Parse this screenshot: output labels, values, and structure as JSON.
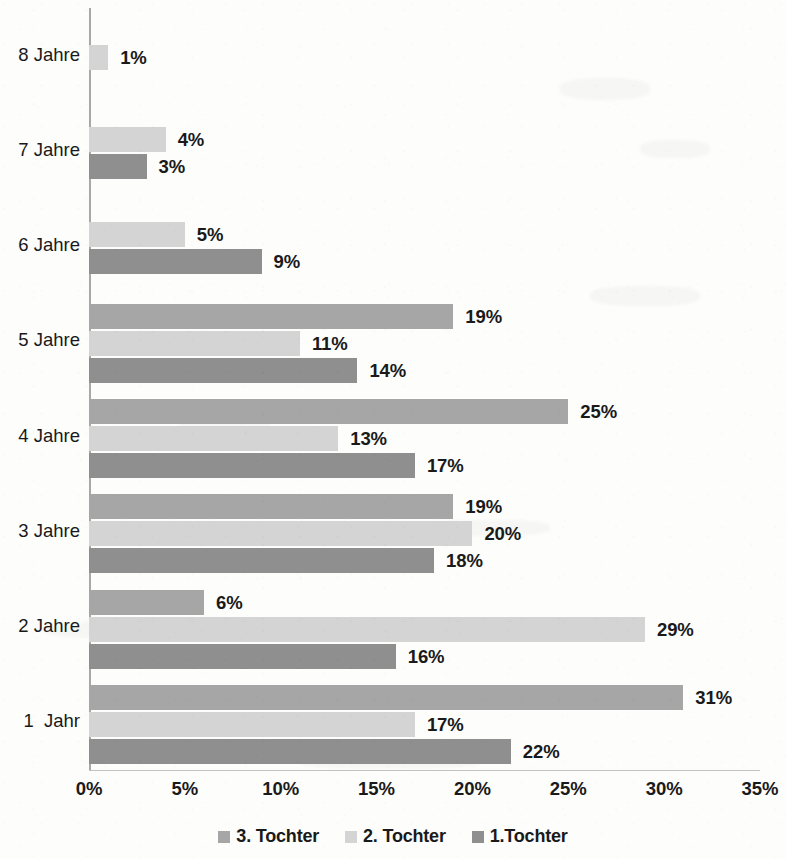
{
  "chart_data": {
    "type": "bar",
    "orientation": "horizontal",
    "title": "",
    "subtitle": "",
    "xlabel": "",
    "ylabel": "",
    "xlim": [
      0,
      35
    ],
    "xtick_labels": [
      "0%",
      "5%",
      "10%",
      "15%",
      "20%",
      "25%",
      "30%",
      "35%"
    ],
    "xticks": [
      0,
      5,
      10,
      15,
      20,
      25,
      30,
      35
    ],
    "grid": false,
    "legend_position": "bottom",
    "categories": [
      "8 Jahre",
      "7 Jahre",
      "6 Jahre",
      "5 Jahre",
      "4 Jahre",
      "3 Jahre",
      "2 Jahre",
      "1  Jahr"
    ],
    "series": [
      {
        "name": "3. Tochter",
        "color": "#a6a6a6",
        "values": [
          null,
          null,
          null,
          19,
          25,
          19,
          6,
          31
        ],
        "labels": [
          "",
          "",
          "",
          "19%",
          "25%",
          "19%",
          "6%",
          "31%"
        ]
      },
      {
        "name": "2. Tochter",
        "color": "#d4d4d4",
        "values": [
          1,
          4,
          5,
          11,
          13,
          20,
          29,
          17
        ],
        "labels": [
          "1%",
          "4%",
          "5%",
          "11%",
          "13%",
          "20%",
          "29%",
          "17%"
        ]
      },
      {
        "name": "1.Tochter",
        "color": "#8f8f8f",
        "values": [
          null,
          3,
          9,
          14,
          17,
          18,
          16,
          22
        ],
        "labels": [
          "",
          "3%",
          "9%",
          "14%",
          "17%",
          "18%",
          "16%",
          "22%"
        ]
      }
    ]
  },
  "legend": {
    "items": [
      {
        "label": "3. Tochter",
        "color": "#a6a6a6"
      },
      {
        "label": "2. Tochter",
        "color": "#d4d4d4"
      },
      {
        "label": "1.Tochter",
        "color": "#8f8f8f"
      }
    ]
  }
}
